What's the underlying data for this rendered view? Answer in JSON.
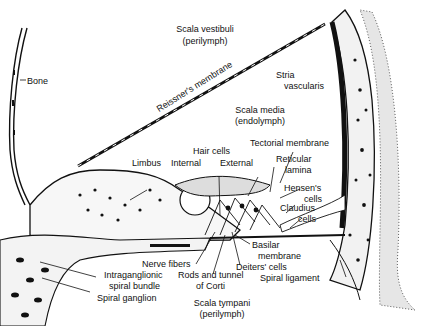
{
  "diagram": {
    "labels": {
      "scala_vestibuli": "Scala vestibuli",
      "scala_vestibuli_fluid": "(perilymph)",
      "bone": "Bone",
      "reissners_membrane": "Reissner's membrane",
      "stria_vascularis_1": "Stria",
      "stria_vascularis_2": "vascularis",
      "scala_media": "Scala media",
      "scala_media_fluid": "(endolymph)",
      "tectorial_membrane": "Tectorial membrane",
      "hair_cells": "Hair cells",
      "limbus": "Limbus",
      "internal": "Internal",
      "external": "External",
      "reticular_lamina_1": "Reticular",
      "reticular_lamina_2": "lamina",
      "hensens_cells_1": "Hensen's",
      "hensens_cells_2": "cells",
      "claudius_cells_1": "Claudius",
      "claudius_cells_2": "cells",
      "basilar_membrane_1": "Basilar",
      "basilar_membrane_2": "membrane",
      "nerve_fibers": "Nerve fibers",
      "deiters_cells": "Deiters' cells",
      "intraganglionic_1": "Intraganglionic",
      "intraganglionic_2": "spiral bundle",
      "rods_tunnel_1": "Rods and tunnel",
      "rods_tunnel_2": "of Corti",
      "spiral_ligament": "Spiral ligament",
      "spiral_ganglion": "Spiral ganglion",
      "scala_tympani": "Scala tympani",
      "scala_tympani_fluid": "(perilymph)"
    },
    "colors": {
      "ink": "#111111",
      "background": "#ffffff",
      "stipple": "#555555"
    }
  }
}
